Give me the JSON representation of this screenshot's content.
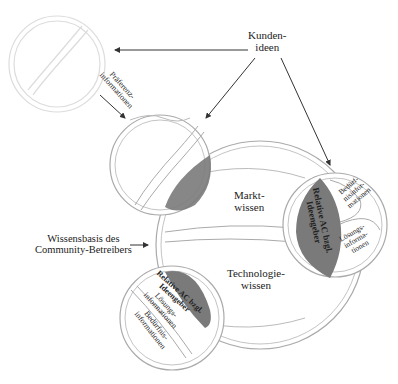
{
  "diagram": {
    "labels": {
      "kunden": "Kunden-\nideen",
      "praeferenz": "Präferenz-\ninformationen",
      "wissensbasis": "Wissensbasis des\nCommunity-Betreibers",
      "markt": "Markt-\nwissen",
      "technologie": "Technologie-\nwissen",
      "relative_right": "Relative AC bzgl.\nIdeengeber",
      "relative_bottom": "Relative AC bzgl.\nIdeengeber",
      "beduerfnis_right": "Bedürf-\nnisinfor-\nmationen",
      "loesung_right": "Lösungs-\ninforma-\ntionen",
      "loesung_bottom": "Lösungs-\ninformationen",
      "beduerfnis_bottom": "Bedürfnis-\ninformationen"
    },
    "colors": {
      "overlap": "#7a7a7a",
      "stroke": "#9a9a9a",
      "faded_stroke": "#d8d8d8"
    }
  }
}
